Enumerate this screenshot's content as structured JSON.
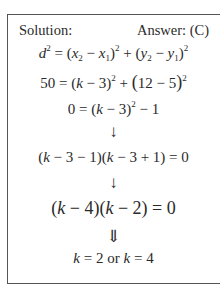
{
  "header": {
    "solution_label": "Solution:",
    "answer_label": "Answer: (C)"
  },
  "steps": [
    {
      "id": "distance-formula",
      "text": "d² = (x₂ − x₁)² + (y₂ − y₁)²"
    },
    {
      "id": "substitute",
      "text": "50 = (k − 3)² + (12 − 5)²"
    },
    {
      "id": "simplify",
      "text": "0 = (k − 3)² − 1"
    },
    {
      "id": "arrow-1",
      "text": "↓"
    },
    {
      "id": "factor",
      "text": "(k − 3 − 1)(k − 3 + 1) = 0"
    },
    {
      "id": "arrow-2",
      "text": "↓"
    },
    {
      "id": "factored",
      "text": "(k − 4)(k − 2) = 0"
    },
    {
      "id": "arrow-3",
      "text": "⇓"
    },
    {
      "id": "result",
      "text": "k = 2 or k = 4"
    }
  ]
}
